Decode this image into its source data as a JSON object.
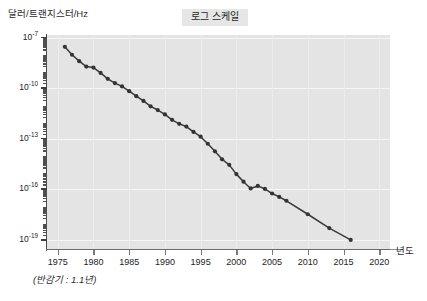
{
  "chart_data": {
    "type": "line",
    "title": "로그 스케일",
    "xlabel": "년도",
    "ylabel": "달러/트랜지스터/Hz",
    "footnote": "(반감기 : 1.1년)",
    "scale": "log-y",
    "grid": true,
    "legend": "none",
    "xlim": [
      1973.5,
      2021.5
    ],
    "ylim_exponent": [
      -19.6,
      -6.85
    ],
    "xticks": [
      1975,
      1980,
      1985,
      1990,
      1995,
      2000,
      2005,
      2010,
      2015,
      2020
    ],
    "xtick_labels": [
      "1975",
      "1980",
      "1985",
      "1990",
      "1995",
      "2000",
      "2005",
      "2010",
      "2015",
      "2020"
    ],
    "ytick_exponents": [
      -7,
      -10,
      -13,
      -16,
      -19
    ],
    "ytick_labels": [
      "10-7",
      "10-10",
      "10-13",
      "10-16",
      "10-19"
    ],
    "ytick_mantissa": "10",
    "ytick_exp_text": [
      "-7",
      "-10",
      "-13",
      "-16",
      "-19"
    ],
    "series": [
      {
        "name": "달러/트랜지스터/Hz",
        "x": [
          1976,
          1977,
          1978,
          1979,
          1980,
          1981,
          1982,
          1983,
          1984,
          1985,
          1986,
          1987,
          1988,
          1989,
          1990,
          1991,
          1992,
          1993,
          1994,
          1995,
          1996,
          1997,
          1998,
          1999,
          2000,
          2001,
          2002,
          2003,
          2004,
          2005,
          2006,
          2007,
          2010,
          2013,
          2016
        ],
        "y_exponent": [
          -7.55,
          -8.02,
          -8.4,
          -8.72,
          -8.78,
          -9.1,
          -9.45,
          -9.7,
          -9.9,
          -10.18,
          -10.48,
          -10.76,
          -11.08,
          -11.3,
          -11.56,
          -11.88,
          -12.12,
          -12.28,
          -12.6,
          -12.88,
          -13.3,
          -13.75,
          -14.22,
          -14.55,
          -15.1,
          -15.55,
          -15.95,
          -15.8,
          -15.98,
          -16.25,
          -16.45,
          -16.68,
          -17.48,
          -18.3,
          -19.0
        ],
        "y": [
          "2.8e-8",
          "9.6e-9",
          "4.0e-9",
          "1.9e-9",
          "1.7e-9",
          "7.9e-10",
          "3.5e-10",
          "2.0e-10",
          "1.3e-10",
          "6.6e-11",
          "3.3e-11",
          "1.7e-11",
          "8.3e-12",
          "5.0e-12",
          "2.8e-12",
          "1.3e-12",
          "7.6e-13",
          "5.2e-13",
          "2.5e-13",
          "1.3e-13",
          "5.0e-14",
          "1.8e-14",
          "6.0e-15",
          "2.8e-15",
          "7.9e-16",
          "2.8e-16",
          "1.1e-16",
          "1.6e-16",
          "1.0e-16",
          "5.6e-17",
          "3.5e-17",
          "2.1e-17",
          "3.3e-18",
          "5.0e-19",
          "1.0e-19"
        ],
        "marker": "circle",
        "color": "#333333"
      }
    ]
  },
  "plot_style": {
    "plot_bg": "#e4e4e4",
    "page_bg": "#ffffff",
    "grid_color": "#f6f6f6",
    "axis_color": "#4a4a4a",
    "line_color": "#3a3a3a",
    "title_bg": "#e6e6e6",
    "text_color": "#232323"
  }
}
